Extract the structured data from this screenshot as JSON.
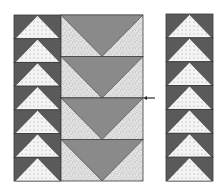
{
  "diagram": {
    "colors": {
      "background": "#ffffff",
      "dark_fabric": "#5a5a5a",
      "medium_fabric": "#8a8a8a",
      "light_dotted": "#f4f4f4",
      "dot": "#9a9a9a",
      "speckled_base": "#e2e2e2",
      "speckle": "#8c8c8c",
      "outline": "#3a3a3a"
    },
    "left_strip": {
      "block_count": 7,
      "x": 14,
      "y": 15,
      "width": 47,
      "height": 166,
      "goose_direction": "up"
    },
    "middle_strip": {
      "block_count": 4,
      "x": 61,
      "y": 15,
      "width": 82,
      "height": 166,
      "goose_direction": "down"
    },
    "right_strip": {
      "block_count": 7,
      "x": 166,
      "y": 14,
      "width": 47,
      "height": 167,
      "goose_direction": "up"
    },
    "arrow": {
      "direction": "left",
      "x": 150,
      "y": 98,
      "icon": "arrow-left-icon"
    }
  }
}
